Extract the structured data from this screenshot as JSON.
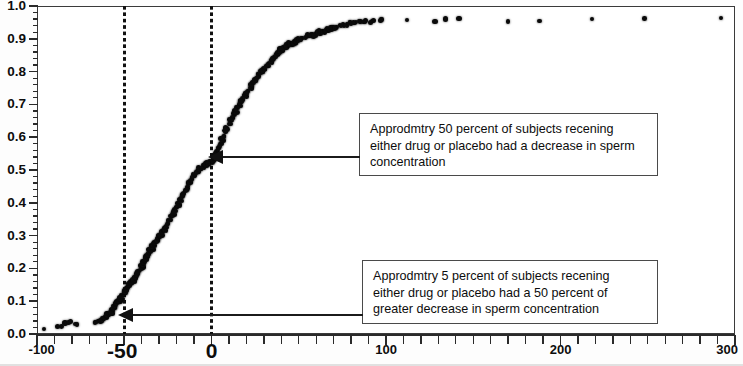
{
  "chart_data": {
    "type": "scatter",
    "title": "",
    "subtitle": "",
    "xlabel": "",
    "ylabel": "",
    "xlim": [
      -100,
      300
    ],
    "ylim": [
      0.0,
      1.0
    ],
    "grid": false,
    "legend_position": "none",
    "x_ticks_major": [
      -100,
      -50,
      0,
      100,
      200,
      300
    ],
    "x_tick_labels": [
      "-100",
      "-50",
      "0",
      "100",
      "200",
      "300"
    ],
    "x_tick_minor_step": 10,
    "y_ticks_major": [
      0.0,
      0.1,
      0.2,
      0.3,
      0.4,
      0.5,
      0.6,
      0.7,
      0.8,
      0.9,
      1.0
    ],
    "y_tick_labels": [
      "0.0",
      "0.1",
      "0.2",
      "0.3",
      "0.4",
      "0.5",
      "0.6",
      "0.7",
      "0.8",
      "0.9",
      "1.0"
    ],
    "y_tick_minor_step": 0.02,
    "reference_lines": [
      {
        "name": "vline-minus-50",
        "orientation": "vertical",
        "value": -50,
        "style": "dotted"
      },
      {
        "name": "vline-zero",
        "orientation": "vertical",
        "value": 0,
        "style": "dotted"
      }
    ],
    "series": [
      {
        "name": "empirical-cdf",
        "marker": "dot",
        "color": "#0a0a0a",
        "points": [
          [
            -96.0,
            0.015
          ],
          [
            -88.5,
            0.022
          ],
          [
            -86.0,
            0.024
          ],
          [
            -84.0,
            0.034
          ],
          [
            -82.0,
            0.036
          ],
          [
            -81.0,
            0.038
          ],
          [
            -78.0,
            0.03
          ],
          [
            -77.0,
            0.028
          ],
          [
            -66.0,
            0.036
          ],
          [
            -64.5,
            0.04
          ],
          [
            -63.0,
            0.042
          ],
          [
            -62.0,
            0.048
          ],
          [
            -61.0,
            0.052
          ],
          [
            -60.0,
            0.056
          ],
          [
            -59.0,
            0.06
          ],
          [
            -58.0,
            0.066
          ],
          [
            -57.0,
            0.072
          ],
          [
            -56.0,
            0.078
          ],
          [
            -55.5,
            0.084
          ],
          [
            -55.0,
            0.09
          ],
          [
            -54.0,
            0.096
          ],
          [
            -53.0,
            0.104
          ],
          [
            -52.0,
            0.11
          ],
          [
            -51.0,
            0.118
          ],
          [
            -50.0,
            0.126
          ],
          [
            -49.0,
            0.134
          ],
          [
            -48.0,
            0.142
          ],
          [
            -47.0,
            0.15
          ],
          [
            -46.0,
            0.158
          ],
          [
            -45.0,
            0.165
          ],
          [
            -44.0,
            0.172
          ],
          [
            -43.0,
            0.18
          ],
          [
            -42.0,
            0.188
          ],
          [
            -41.0,
            0.196
          ],
          [
            -40.0,
            0.205
          ],
          [
            -39.5,
            0.214
          ],
          [
            -39.0,
            0.222
          ],
          [
            -38.0,
            0.23
          ],
          [
            -37.0,
            0.238
          ],
          [
            -36.0,
            0.246
          ],
          [
            -35.0,
            0.254
          ],
          [
            -34.0,
            0.262
          ],
          [
            -33.5,
            0.268
          ],
          [
            -33.0,
            0.276
          ],
          [
            -32.0,
            0.284
          ],
          [
            -31.0,
            0.29
          ],
          [
            -30.0,
            0.296
          ],
          [
            -29.5,
            0.3
          ],
          [
            -29.0,
            0.304
          ],
          [
            -28.0,
            0.312
          ],
          [
            -27.0,
            0.32
          ],
          [
            -26.0,
            0.328
          ],
          [
            -25.0,
            0.338
          ],
          [
            -24.0,
            0.348
          ],
          [
            -23.0,
            0.358
          ],
          [
            -22.0,
            0.368
          ],
          [
            -21.0,
            0.378
          ],
          [
            -20.0,
            0.388
          ],
          [
            -19.0,
            0.398
          ],
          [
            -18.0,
            0.408
          ],
          [
            -17.0,
            0.418
          ],
          [
            -16.0,
            0.428
          ],
          [
            -15.0,
            0.438
          ],
          [
            -14.0,
            0.448
          ],
          [
            -13.0,
            0.458
          ],
          [
            -12.0,
            0.466
          ],
          [
            -11.0,
            0.474
          ],
          [
            -10.0,
            0.482
          ],
          [
            -9.0,
            0.49
          ],
          [
            -8.0,
            0.496
          ],
          [
            -7.0,
            0.502
          ],
          [
            -6.0,
            0.506
          ],
          [
            -5.0,
            0.51
          ],
          [
            -4.0,
            0.514
          ],
          [
            -3.0,
            0.518
          ],
          [
            -2.0,
            0.52
          ],
          [
            -1.0,
            0.522
          ],
          [
            0.0,
            0.524
          ],
          [
            1.0,
            0.532
          ],
          [
            2.0,
            0.544
          ],
          [
            3.0,
            0.556
          ],
          [
            4.0,
            0.568
          ],
          [
            5.0,
            0.58
          ],
          [
            6.0,
            0.592
          ],
          [
            7.0,
            0.604
          ],
          [
            8.0,
            0.616
          ],
          [
            9.0,
            0.628
          ],
          [
            10.0,
            0.64
          ],
          [
            11.0,
            0.65
          ],
          [
            12.0,
            0.66
          ],
          [
            13.0,
            0.67
          ],
          [
            14.0,
            0.68
          ],
          [
            15.0,
            0.69
          ],
          [
            16.0,
            0.7
          ],
          [
            17.0,
            0.71
          ],
          [
            18.0,
            0.718
          ],
          [
            19.0,
            0.726
          ],
          [
            20.0,
            0.734
          ],
          [
            21.0,
            0.742
          ],
          [
            22.0,
            0.75
          ],
          [
            23.0,
            0.758
          ],
          [
            24.0,
            0.766
          ],
          [
            25.0,
            0.774
          ],
          [
            26.0,
            0.782
          ],
          [
            27.0,
            0.79
          ],
          [
            28.0,
            0.796
          ],
          [
            29.0,
            0.802
          ],
          [
            30.0,
            0.808
          ],
          [
            31.0,
            0.814
          ],
          [
            32.0,
            0.82
          ],
          [
            33.0,
            0.826
          ],
          [
            34.0,
            0.832
          ],
          [
            35.0,
            0.838
          ],
          [
            36.0,
            0.844
          ],
          [
            37.0,
            0.85
          ],
          [
            38.0,
            0.856
          ],
          [
            39.0,
            0.86
          ],
          [
            40.0,
            0.864
          ],
          [
            41.0,
            0.868
          ],
          [
            42.0,
            0.872
          ],
          [
            43.0,
            0.876
          ],
          [
            44.0,
            0.88
          ],
          [
            45.0,
            0.884
          ],
          [
            46.0,
            0.886
          ],
          [
            47.0,
            0.888
          ],
          [
            48.0,
            0.89
          ],
          [
            49.0,
            0.894
          ],
          [
            50.0,
            0.898
          ],
          [
            52.0,
            0.902
          ],
          [
            54.0,
            0.906
          ],
          [
            56.0,
            0.91
          ],
          [
            58.0,
            0.912
          ],
          [
            60.0,
            0.916
          ],
          [
            62.0,
            0.92
          ],
          [
            64.0,
            0.924
          ],
          [
            66.0,
            0.928
          ],
          [
            68.0,
            0.93
          ],
          [
            70.0,
            0.934
          ],
          [
            72.0,
            0.936
          ],
          [
            74.0,
            0.938
          ],
          [
            76.0,
            0.942
          ],
          [
            78.0,
            0.944
          ],
          [
            80.0,
            0.946
          ],
          [
            82.0,
            0.948
          ],
          [
            85.0,
            0.95
          ],
          [
            88.0,
            0.952
          ],
          [
            92.0,
            0.954
          ],
          [
            97.0,
            0.956
          ],
          [
            112.0,
            0.958
          ],
          [
            128.0,
            0.952
          ],
          [
            134.0,
            0.96
          ],
          [
            142.0,
            0.962
          ],
          [
            170.0,
            0.952
          ],
          [
            188.0,
            0.954
          ],
          [
            218.0,
            0.96
          ],
          [
            248.0,
            0.962
          ],
          [
            292.0,
            0.964
          ]
        ]
      }
    ],
    "annotations": [
      {
        "name": "annotation-50-percent-decrease",
        "text": "Approdmtry 50 percent of subjects recening\neither drug or placebo had a decrease in sperm\nconcentration",
        "points_to": {
          "x": 0,
          "y": 0.525
        }
      },
      {
        "name": "annotation-5-percent-50-or-greater-decrease",
        "text": "Approdmtry 5 percent of subjects recening\neither drug or placebo had a 50 percent of\ngreater decrease in sperm concentration",
        "points_to": {
          "x": -50,
          "y": 0.055
        }
      }
    ],
    "colors": {
      "marker": "#0a0a0a",
      "axis": "#2a2a2a",
      "frame": "#3a3a3a",
      "callout_border": "#4a4a4a",
      "arrow": "#111111",
      "background": "#ffffff"
    }
  }
}
